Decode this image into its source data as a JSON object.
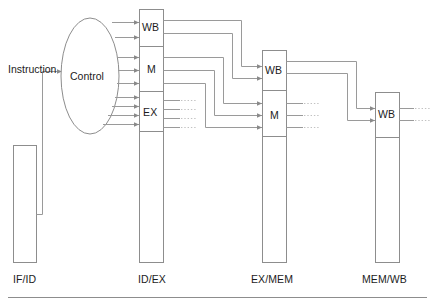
{
  "diagram": {
    "input_label": "Instruction",
    "control_unit": {
      "label": "Control",
      "shape": "ellipse"
    },
    "colors": {
      "wire": "#9a9a9a",
      "wire_faint": "#c2c2c2",
      "box_border": "#8d8d8d",
      "text": "#1c1c1c",
      "background": "#ffffff"
    },
    "stages": [
      {
        "id": "if_id",
        "label": "IF/ID",
        "segments": []
      },
      {
        "id": "id_ex",
        "label": "ID/EX",
        "segments": [
          {
            "label": "WB",
            "signal_count": 2
          },
          {
            "label": "M",
            "signal_count": 3
          },
          {
            "label": "EX",
            "signal_count": 4
          }
        ]
      },
      {
        "id": "ex_mem",
        "label": "EX/MEM",
        "segments": [
          {
            "label": "WB",
            "signal_count": 2
          },
          {
            "label": "M",
            "signal_count": 3
          }
        ]
      },
      {
        "id": "mem_wb",
        "label": "MEM/WB",
        "segments": [
          {
            "label": "WB",
            "signal_count": 2
          }
        ]
      }
    ],
    "ellipsis_marks": [
      {
        "near": "id_ex.EX",
        "rows": 4,
        "glyph": "..."
      },
      {
        "near": "ex_mem.M",
        "rows": 3,
        "glyph": "..."
      },
      {
        "near": "mem_wb.WB",
        "rows": 2,
        "glyph": "..."
      }
    ]
  }
}
